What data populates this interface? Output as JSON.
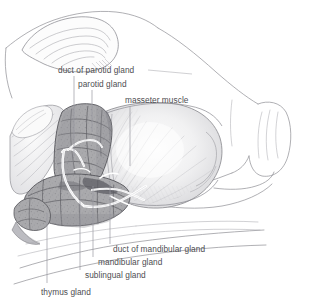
{
  "figure": {
    "style": "pencil / graphite anatomical illustration",
    "background_color": "#ffffff",
    "ink_color": "#6e6e73",
    "gland_fill_color": "#a9a9ac",
    "gland_outline_color": "#55555a",
    "muscle_fill_color": "#f2f2f3",
    "duct_color": "#ffffff",
    "leader_line_color": "#9a9aa0",
    "label_text_color": "#4e4e52"
  },
  "labels": [
    {
      "id": "duct-of-parotid-gland",
      "text": "duct of parotid gland",
      "x": 58,
      "y": 66,
      "leader": {
        "x1": 74,
        "y1": 76,
        "x2": 74,
        "y2": 156
      }
    },
    {
      "id": "parotid-gland",
      "text": "parotid gland",
      "x": 78,
      "y": 80,
      "leader": {
        "x1": 92,
        "y1": 90,
        "x2": 92,
        "y2": 132
      }
    },
    {
      "id": "masseter-muscle",
      "text": "masseter muscle",
      "x": 125,
      "y": 96,
      "leader": {
        "x1": 130,
        "y1": 106,
        "x2": 130,
        "y2": 166
      }
    },
    {
      "id": "duct-of-mandibular-gland",
      "text": "duct of mandibular gland",
      "x": 113,
      "y": 245,
      "leader": {
        "x1": 110,
        "y1": 244,
        "x2": 110,
        "y2": 182
      }
    },
    {
      "id": "mandibular-gland",
      "text": "mandibular gland",
      "x": 98,
      "y": 258,
      "leader": {
        "x1": 93,
        "y1": 257,
        "x2": 93,
        "y2": 186
      }
    },
    {
      "id": "sublingual-gland",
      "text": "sublingual gland",
      "x": 85,
      "y": 271,
      "leader": {
        "x1": 80,
        "y1": 270,
        "x2": 80,
        "y2": 192
      }
    },
    {
      "id": "thymus-gland",
      "text": "thymus gland",
      "x": 41,
      "y": 288,
      "leader": {
        "x1": 47,
        "y1": 283,
        "x2": 47,
        "y2": 213
      }
    }
  ]
}
